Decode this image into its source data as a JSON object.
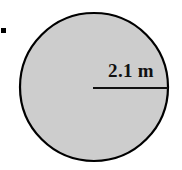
{
  "figure": {
    "type": "geometry-diagram",
    "shape_name": "circle",
    "background_color": "#ffffff",
    "canvas": {
      "width": 182,
      "height": 170
    },
    "bullet_marker": {
      "name": "list-bullet",
      "color": "#000000",
      "x": 2,
      "y": 30,
      "size": 5
    },
    "circle": {
      "fill_color": "#cdcdcd",
      "stroke_color": "#000000",
      "stroke_width": 2,
      "center_x": 94,
      "center_y": 87,
      "radius": 75,
      "bounds": {
        "left": 19,
        "top": 12,
        "right": 169,
        "bottom": 162
      }
    },
    "radius_line": {
      "name": "radius-dimension-line",
      "color": "#111111",
      "thickness": 2,
      "x1": 93,
      "y1": 88,
      "x2": 168,
      "y2": 88
    },
    "dimension_label": {
      "text": "2.1 m",
      "value": "2.1",
      "unit": "m",
      "quantity": "radius",
      "color": "#111111"
    }
  }
}
